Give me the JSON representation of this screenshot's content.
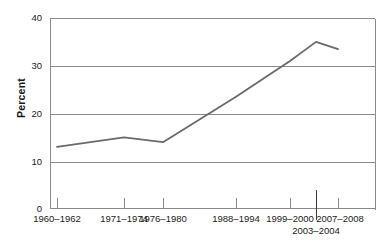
{
  "chart_data": {
    "type": "line",
    "title": "",
    "xlabel": "",
    "ylabel": "Percent",
    "ylim": [
      0,
      40
    ],
    "y_ticks": [
      0,
      10,
      20,
      30,
      40
    ],
    "y_tick_labels": [
      "0",
      "10",
      "20",
      "30",
      "40"
    ],
    "grid": "horizontal",
    "legend": "none",
    "categories": [
      "1960–1962",
      "1971–1974",
      "1976–1980",
      "1988–1994",
      "1999–2000",
      "2003–2004",
      "2007–2008"
    ],
    "values": [
      13,
      15,
      14,
      23.5,
      31,
      35,
      33.5
    ],
    "series": [
      {
        "name": "Percent",
        "color": "#6a6a6a",
        "values": [
          13,
          15,
          14,
          23.5,
          31,
          35,
          33.5
        ]
      }
    ],
    "x_tick_labels_row1": [
      "1960–1962",
      "1971–1974",
      "1976–1980",
      "1988–1994",
      "1999–2000",
      "2007–2008"
    ],
    "x_tick_labels_row2": [
      "2003–2004"
    ],
    "axis_color": "#8a8a8a",
    "line_color": "#6a6a6a",
    "background": "#ffffff"
  },
  "axis": {
    "y_title": "Percent",
    "y_labels": {
      "t40": "40",
      "t30": "30",
      "t20": "20",
      "t10": "10",
      "t0": "0"
    },
    "x_labels": {
      "p1": "1960–1962",
      "p2": "1971–1974",
      "p3": "1976–1980",
      "p4": "1988–1994",
      "p5": "1999–2000",
      "p6": "2003–2004",
      "p7": "2007–2008"
    }
  }
}
